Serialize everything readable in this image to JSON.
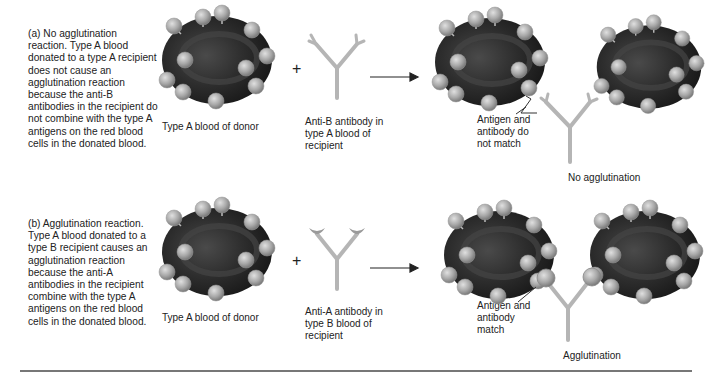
{
  "panels": [
    {
      "id": "a",
      "description": "(a) No agglutination reaction. Type A blood donated to a type A recipient does not cause an agglutination reaction because the anti-B antibodies in the recipient do not combine with the type A antigens on the red blood cells in the donated blood.",
      "donor_label": "Type A blood of donor",
      "plus": "+",
      "antibody_label": "Anti-B antibody in type A blood of recipient",
      "match_label": "Antigen and antibody do not match",
      "result_label": "No agglutination"
    },
    {
      "id": "b",
      "description": "(b) Agglutination reaction. Type A blood donated to a type B recipient causes an agglutination reaction because the anti-A antibodies in the recipient combine with the type A antigens on the red blood cells in the donated blood.",
      "donor_label": "Type A blood of donor",
      "plus": "+",
      "antibody_label": "Anti-A antibody in type B blood of recipient",
      "match_label": "Antigen and antibody match",
      "result_label": "Agglutination"
    }
  ],
  "colors": {
    "cell": "#2a2a2a",
    "antigen": "#a8a8a8",
    "antibody": "#b5b5b5",
    "rule": "#777777"
  }
}
